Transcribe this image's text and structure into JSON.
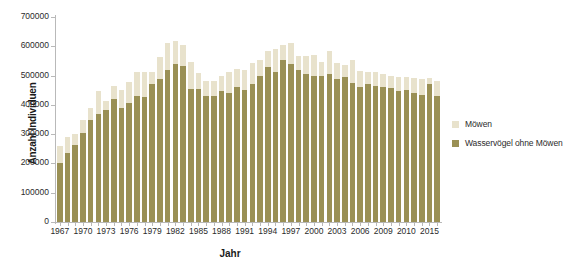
{
  "chart_data": {
    "type": "bar",
    "stacked": true,
    "title": "",
    "xlabel": "Jahr",
    "ylabel": "Anzahl Individuen",
    "ylim": [
      0,
      700000
    ],
    "yticks": [
      0,
      100000,
      200000,
      300000,
      400000,
      500000,
      600000,
      700000
    ],
    "ytick_labels": [
      "0",
      "100000",
      "200000",
      "300000",
      "400000",
      "500000",
      "600000",
      "700000"
    ],
    "grid": false,
    "legend_position": "right",
    "x": [
      1967,
      1968,
      1969,
      1970,
      1971,
      1972,
      1973,
      1974,
      1975,
      1976,
      1977,
      1978,
      1979,
      1980,
      1981,
      1982,
      1983,
      1984,
      1985,
      1986,
      1987,
      1988,
      1989,
      1990,
      1991,
      1992,
      1993,
      1994,
      1995,
      1996,
      1997,
      1998,
      1999,
      2000,
      2001,
      2002,
      2003,
      2004,
      2005,
      2006,
      2007,
      2008,
      2009,
      2010,
      2011,
      2012,
      2013,
      2014,
      2015,
      2016
    ],
    "xtick_labels": [
      "1967",
      "1970",
      "1973",
      "1976",
      "1979",
      "1982",
      "1985",
      "1988",
      "1991",
      "1994",
      "1997",
      "2000",
      "2003",
      "2006",
      "2009",
      "2010",
      "2015"
    ],
    "xtick_years": [
      1967,
      1970,
      1973,
      1976,
      1979,
      1982,
      1985,
      1988,
      1991,
      1994,
      1997,
      2000,
      2003,
      2006,
      2009,
      2012,
      2015
    ],
    "series": [
      {
        "name": "Wasservögel ohne Möwen",
        "color": "#9a9055",
        "values": [
          200000,
          235000,
          262000,
          303000,
          348000,
          368000,
          383000,
          420000,
          390000,
          408000,
          432000,
          428000,
          470000,
          490000,
          520000,
          540000,
          533000,
          455000,
          455000,
          430000,
          432000,
          448000,
          440000,
          462000,
          450000,
          470000,
          498000,
          530000,
          512000,
          552000,
          540000,
          520000,
          505000,
          500000,
          498000,
          505000,
          490000,
          495000,
          475000,
          462000,
          470000,
          465000,
          462000,
          458000,
          448000,
          452000,
          440000,
          435000,
          470000,
          432000
        ]
      },
      {
        "name": "Möwen",
        "color": "#e8e2cc",
        "values": [
          58000,
          55000,
          40000,
          45000,
          42000,
          78000,
          30000,
          45000,
          62000,
          70000,
          82000,
          85000,
          42000,
          72000,
          92000,
          78000,
          72000,
          92000,
          55000,
          52000,
          48000,
          50000,
          72000,
          62000,
          70000,
          72000,
          55000,
          55000,
          78000,
          52000,
          70000,
          48000,
          62000,
          70000,
          48000,
          78000,
          52000,
          42000,
          78000,
          55000,
          42000,
          48000,
          45000,
          42000,
          48000,
          42000,
          52000,
          52000,
          22000,
          48000
        ]
      }
    ]
  },
  "legend": {
    "items": [
      {
        "label": "Möwen",
        "color": "#e8e2cc"
      },
      {
        "label": "Wasservögel ohne Möwen",
        "color": "#9a9055"
      }
    ]
  }
}
